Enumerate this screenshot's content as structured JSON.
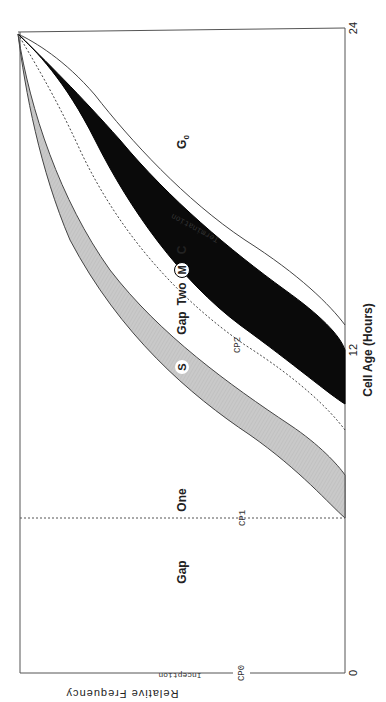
{
  "figure": {
    "orientation": "rotated 90 degrees clockwise",
    "x_axis": {
      "label": "Cell Age (Hours)",
      "ticks": [
        "0",
        "12",
        "24"
      ]
    },
    "y_axis": {
      "label": "Relative Frequency"
    },
    "phase_labels": {
      "gap1_a": "Gap",
      "gap1_b": "One",
      "s": "S",
      "gap2_a": "Gap",
      "gap2_b": "Two",
      "m": "M",
      "c": "C",
      "g0": "G",
      "g0_sub": "0"
    },
    "checkpoints": {
      "cp0": "CP0",
      "cp1": "CP1",
      "cp2": "CP2"
    },
    "annotations": {
      "inception": "Inception",
      "termination": "Termination"
    },
    "colors": {
      "s_band": "#c8c8c8",
      "m_band": "#0a0a0a",
      "line": "#333333",
      "background": "#ffffff"
    }
  }
}
